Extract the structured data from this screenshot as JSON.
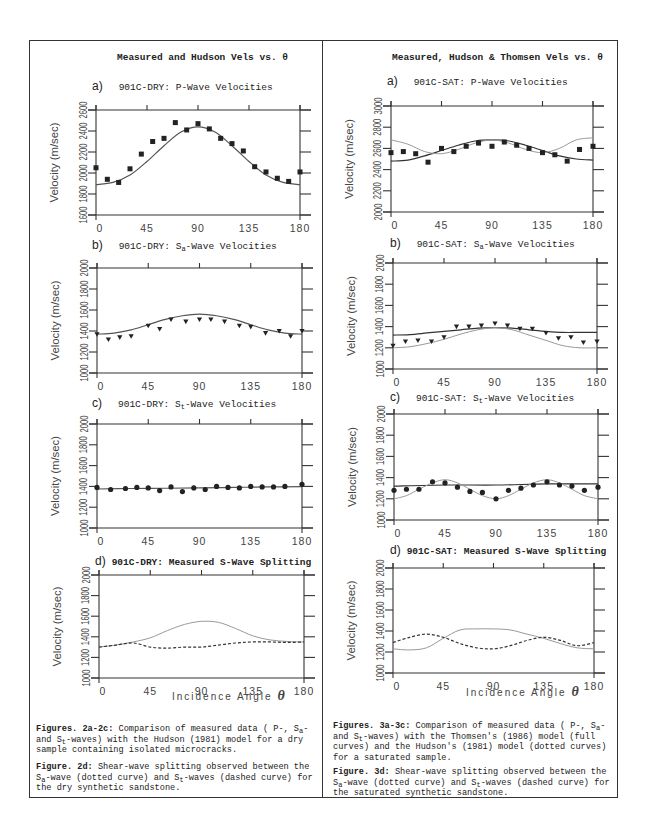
{
  "left": {
    "title": "Measured and Hudson Vels vs. θ",
    "xlabel_text": "Incidence Angle ",
    "xlabel_symbol": "θ",
    "caption1": {
      "bold": "Figures. 2a-2c:",
      "t1": " Comparison of measured data (  P-, ",
      "s1": "S",
      "s1sub": "a",
      "t2": "- and   ",
      "s2": "S",
      "s2sub": "t",
      "t3": "-waves) with the Hudson (1981) model for a dry sample containing isolated microcracks."
    },
    "caption2": {
      "bold": "Figure. 2d:",
      "t1": " Shear-wave splitting observed between the ",
      "s1": "S",
      "s1sub": "a",
      "t2": "-wave (dotted curve) and ",
      "s2": "S",
      "s2sub": "t",
      "t3": "-waves (dashed curve) for the dry synthetic sandstone."
    }
  },
  "right": {
    "title": "Measured, Hudson & Thomsen Vels vs. θ",
    "xlabel_text": "Incidence Angle ",
    "xlabel_symbol": "θ",
    "caption1": {
      "bold": "Figures. 3a-3c:",
      "t1": " Comparison of measured data (  P-, ",
      "s1": "S",
      "s1sub": "a",
      "t2": "- and   ",
      "s2": "S",
      "s2sub": "t",
      "t3": "-waves) with the Thomsen's (1986) model (full curves) and the Hudson's (1981) model (dotted curves) for a saturated sample."
    },
    "caption2": {
      "bold": "Figure. 3d:",
      "t1": " Shear-wave splitting observed between the ",
      "s1": "S",
      "s1sub": "a",
      "t2": "-wave (dotted curve) and ",
      "s2": "S",
      "s2sub": "t",
      "t3": "-waves (dashed curve) for the saturated synthetic sandstone."
    }
  },
  "chart_data": [
    {
      "id": "L-a",
      "type": "scatter",
      "panel_label": "a)",
      "title": "901C-DRY: P-Wave Velocities",
      "xlabel": "",
      "ylabel": "Velocity (m/sec)",
      "xticks": [
        0,
        45,
        90,
        135,
        180
      ],
      "yticks": [
        1600,
        1800,
        2000,
        2200,
        2400,
        2600
      ],
      "xlim": [
        0,
        180
      ],
      "ylim": [
        1600,
        2600
      ],
      "box": [
        96,
        110,
        300,
        215
      ],
      "marker": "square",
      "points": {
        "x": [
          0,
          10,
          20,
          30,
          40,
          50,
          60,
          70,
          80,
          90,
          100,
          110,
          120,
          130,
          140,
          150,
          160,
          170,
          180
        ],
        "y": [
          2050,
          1940,
          1910,
          2040,
          2180,
          2300,
          2330,
          2480,
          2410,
          2470,
          2420,
          2330,
          2280,
          2210,
          2060,
          2010,
          1950,
          1920,
          2010
        ]
      },
      "series": [
        {
          "name": "Hudson (1981)",
          "style": "solid",
          "color": "#555555",
          "x": [
            0,
            15,
            30,
            45,
            60,
            75,
            90,
            105,
            120,
            135,
            150,
            165,
            180
          ],
          "y": [
            1890,
            1910,
            1980,
            2110,
            2260,
            2390,
            2440,
            2390,
            2260,
            2110,
            1980,
            1910,
            1890
          ]
        }
      ]
    },
    {
      "id": "L-b",
      "type": "scatter",
      "panel_label": "b)",
      "title": "901C-DRY: S",
      "title_sub": "a",
      "title_rest": "-Wave Velocities",
      "ylabel": "Velocity (m/sec)",
      "xticks": [
        0,
        45,
        90,
        135,
        180
      ],
      "yticks": [
        1000,
        1200,
        1400,
        1600,
        1800,
        2000
      ],
      "xlim": [
        0,
        180
      ],
      "ylim": [
        1000,
        2000
      ],
      "box": [
        97,
        268,
        302,
        373
      ],
      "marker": "triangle",
      "points": {
        "x": [
          0,
          10,
          20,
          30,
          45,
          55,
          65,
          78,
          90,
          100,
          112,
          125,
          135,
          148,
          160,
          170,
          180
        ],
        "y": [
          1370,
          1320,
          1340,
          1350,
          1450,
          1420,
          1510,
          1490,
          1510,
          1510,
          1490,
          1450,
          1440,
          1380,
          1400,
          1350,
          1400
        ]
      },
      "series": [
        {
          "name": "Hudson (1981)",
          "style": "solid",
          "color": "#555555",
          "x": [
            0,
            15,
            30,
            45,
            60,
            75,
            90,
            105,
            120,
            135,
            150,
            165,
            180
          ],
          "y": [
            1370,
            1380,
            1410,
            1460,
            1510,
            1545,
            1560,
            1545,
            1510,
            1460,
            1410,
            1380,
            1370
          ]
        }
      ]
    },
    {
      "id": "L-c",
      "type": "scatter",
      "panel_label": "c)",
      "title": "901C-DRY: S",
      "title_sub": "t",
      "title_rest": "-Wave Velocities",
      "ylabel": "Velocity (m/sec)",
      "xticks": [
        0,
        45,
        90,
        135,
        180
      ],
      "yticks": [
        1000,
        1200,
        1400,
        1600,
        1800,
        2000
      ],
      "xlim": [
        0,
        180
      ],
      "ylim": [
        1000,
        2000
      ],
      "box": [
        97,
        424,
        302,
        528
      ],
      "marker": "circle",
      "points": {
        "x": [
          0,
          12,
          25,
          35,
          45,
          55,
          65,
          75,
          85,
          95,
          105,
          115,
          125,
          135,
          145,
          155,
          165,
          180
        ],
        "y": [
          1390,
          1370,
          1380,
          1390,
          1385,
          1360,
          1395,
          1350,
          1385,
          1370,
          1400,
          1390,
          1385,
          1400,
          1395,
          1395,
          1400,
          1420
        ]
      },
      "series": [
        {
          "name": "Hudson (1981)",
          "style": "solid",
          "color": "#555555",
          "x": [
            0,
            30,
            60,
            90,
            120,
            150,
            180
          ],
          "y": [
            1375,
            1380,
            1382,
            1385,
            1390,
            1395,
            1398
          ]
        }
      ]
    },
    {
      "id": "L-d",
      "type": "line",
      "panel_label": "d)",
      "title": "901C-DRY: Measured S-Wave Splitting",
      "ylabel": "Velocity (m/sec)",
      "xlabel": "Incidence Angle θ",
      "xticks": [
        0,
        45,
        90,
        135,
        180
      ],
      "yticks": [
        1000,
        1200,
        1400,
        1600,
        1800,
        2000
      ],
      "xlim": [
        0,
        180
      ],
      "ylim": [
        1000,
        2000
      ],
      "box": [
        99,
        575,
        304,
        678
      ],
      "series": [
        {
          "name": "Sa-wave",
          "style": "dotted",
          "color": "#999999",
          "x": [
            0,
            15,
            30,
            45,
            60,
            75,
            90,
            105,
            120,
            135,
            150,
            165,
            180
          ],
          "y": [
            1300,
            1320,
            1350,
            1390,
            1460,
            1520,
            1550,
            1540,
            1480,
            1410,
            1370,
            1355,
            1350
          ]
        },
        {
          "name": "St-wave",
          "style": "dashed",
          "color": "#333333",
          "x": [
            0,
            15,
            30,
            45,
            60,
            75,
            90,
            105,
            120,
            135,
            150,
            165,
            180
          ],
          "y": [
            1300,
            1320,
            1340,
            1300,
            1290,
            1300,
            1300,
            1320,
            1340,
            1350,
            1350,
            1345,
            1350
          ]
        }
      ]
    },
    {
      "id": "R-a",
      "type": "scatter",
      "panel_label": "a)",
      "title": "901C-SAT: P-Wave Velocities",
      "ylabel": "Velocity (m/sec)",
      "xticks": [
        0,
        45,
        90,
        135,
        180
      ],
      "yticks": [
        2000,
        2200,
        2400,
        2600,
        2800,
        3000
      ],
      "xlim": [
        0,
        180
      ],
      "ylim": [
        2000,
        3000
      ],
      "box": [
        391,
        106,
        593,
        212
      ],
      "marker": "square",
      "points": {
        "x": [
          0,
          11,
          22,
          33,
          45,
          56,
          67,
          78,
          90,
          101,
          112,
          123,
          135,
          146,
          157,
          168,
          180
        ],
        "y": [
          2560,
          2570,
          2550,
          2470,
          2600,
          2570,
          2620,
          2650,
          2620,
          2660,
          2630,
          2600,
          2560,
          2540,
          2480,
          2590,
          2620
        ]
      },
      "series": [
        {
          "name": "Thomsen (1986)",
          "style": "solid",
          "color": "#333333",
          "x": [
            0,
            15,
            30,
            45,
            60,
            75,
            90,
            105,
            120,
            135,
            150,
            165,
            180
          ],
          "y": [
            2480,
            2490,
            2530,
            2580,
            2630,
            2670,
            2680,
            2670,
            2630,
            2580,
            2530,
            2500,
            2490
          ]
        },
        {
          "name": "Hudson (1981)",
          "style": "dotted",
          "color": "#999999",
          "x": [
            0,
            15,
            30,
            45,
            60,
            75,
            90,
            105,
            120,
            135,
            150,
            165,
            180
          ],
          "y": [
            2680,
            2640,
            2570,
            2550,
            2590,
            2650,
            2680,
            2650,
            2590,
            2560,
            2600,
            2680,
            2700
          ]
        }
      ]
    },
    {
      "id": "R-b",
      "type": "scatter",
      "panel_label": "b)",
      "title": "901C-SAT: S",
      "title_sub": "a",
      "title_rest": "-Wave Velocities",
      "ylabel": "Velocity (m/sec)",
      "xticks": [
        0,
        45,
        90,
        135,
        180
      ],
      "yticks": [
        1000,
        1200,
        1400,
        1600,
        1800,
        2000
      ],
      "xlim": [
        0,
        180
      ],
      "ylim": [
        1000,
        2000
      ],
      "box": [
        393,
        263,
        597,
        369
      ],
      "marker": "triangle",
      "points": {
        "x": [
          0,
          11,
          22,
          34,
          45,
          56,
          67,
          78,
          90,
          101,
          112,
          123,
          135,
          146,
          157,
          168,
          180
        ],
        "y": [
          1220,
          1260,
          1270,
          1260,
          1300,
          1400,
          1400,
          1410,
          1430,
          1410,
          1380,
          1380,
          1340,
          1290,
          1300,
          1250,
          1260
        ]
      },
      "series": [
        {
          "name": "Thomsen (1986)",
          "style": "solid",
          "color": "#333333",
          "x": [
            0,
            15,
            30,
            45,
            60,
            75,
            90,
            105,
            120,
            135,
            150,
            165,
            180
          ],
          "y": [
            1320,
            1325,
            1340,
            1355,
            1370,
            1385,
            1390,
            1385,
            1370,
            1355,
            1345,
            1345,
            1345
          ]
        },
        {
          "name": "Hudson (1981)",
          "style": "dotted",
          "color": "#999999",
          "x": [
            0,
            15,
            30,
            45,
            60,
            75,
            90,
            105,
            120,
            135,
            150,
            165,
            180
          ],
          "y": [
            1200,
            1210,
            1240,
            1280,
            1330,
            1370,
            1390,
            1370,
            1320,
            1270,
            1220,
            1200,
            1200
          ]
        }
      ]
    },
    {
      "id": "R-c",
      "type": "scatter",
      "panel_label": "c)",
      "title": "901C-SAT: S",
      "title_sub": "t",
      "title_rest": "-Wave Velocities",
      "ylabel": "Velocity (m/sec)",
      "xticks": [
        0,
        45,
        90,
        135,
        180
      ],
      "yticks": [
        1000,
        1200,
        1400,
        1600,
        1800,
        2000
      ],
      "xlim": [
        0,
        180
      ],
      "ylim": [
        1000,
        2000
      ],
      "box": [
        394,
        414,
        598,
        520
      ],
      "marker": "circle",
      "points": {
        "x": [
          0,
          11,
          22,
          34,
          45,
          56,
          67,
          78,
          90,
          101,
          112,
          123,
          135,
          146,
          157,
          168,
          180
        ],
        "y": [
          1280,
          1290,
          1290,
          1360,
          1350,
          1310,
          1270,
          1260,
          1200,
          1280,
          1300,
          1330,
          1360,
          1330,
          1320,
          1280,
          1310
        ]
      },
      "series": [
        {
          "name": "Thomsen (1986)",
          "style": "solid",
          "color": "#333333",
          "x": [
            0,
            45,
            90,
            135,
            180
          ],
          "y": [
            1320,
            1330,
            1330,
            1340,
            1340
          ]
        },
        {
          "name": "Hudson (1981)",
          "style": "dotted",
          "color": "#999999",
          "x": [
            0,
            11,
            22,
            34,
            45,
            56,
            67,
            78,
            90,
            101,
            112,
            123,
            135,
            146,
            157,
            168,
            180
          ],
          "y": [
            1200,
            1230,
            1290,
            1350,
            1380,
            1350,
            1290,
            1230,
            1200,
            1230,
            1290,
            1350,
            1380,
            1350,
            1290,
            1230,
            1200
          ]
        }
      ]
    },
    {
      "id": "R-d",
      "type": "line",
      "panel_label": "d)",
      "title": "901C-SAT: Measured S-Wave Splitting",
      "ylabel": "Velocity (m/sec)",
      "xlabel": "Incidence Angle θ",
      "xticks": [
        0,
        45,
        90,
        135,
        180
      ],
      "yticks": [
        1000,
        1200,
        1400,
        1600,
        1800,
        2000
      ],
      "xlim": [
        0,
        180
      ],
      "ylim": [
        1000,
        2000
      ],
      "box": [
        393,
        568,
        594,
        673
      ],
      "series": [
        {
          "name": "Sa-wave",
          "style": "dotted",
          "color": "#999999",
          "x": [
            0,
            15,
            30,
            45,
            60,
            75,
            90,
            105,
            120,
            135,
            150,
            165,
            180
          ],
          "y": [
            1230,
            1220,
            1240,
            1330,
            1410,
            1420,
            1420,
            1410,
            1370,
            1330,
            1280,
            1240,
            1230
          ]
        },
        {
          "name": "St-wave",
          "style": "dashed",
          "color": "#333333",
          "x": [
            0,
            15,
            30,
            45,
            60,
            75,
            90,
            105,
            120,
            135,
            150,
            165,
            180
          ],
          "y": [
            1290,
            1340,
            1370,
            1340,
            1280,
            1240,
            1230,
            1260,
            1310,
            1340,
            1310,
            1260,
            1290
          ]
        }
      ]
    }
  ]
}
